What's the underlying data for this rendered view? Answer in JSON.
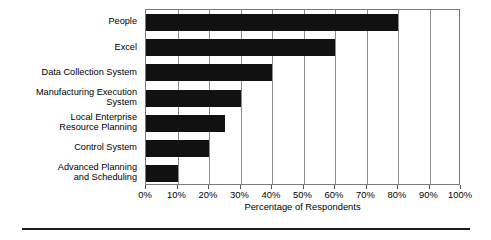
{
  "chart_data": {
    "type": "bar",
    "orientation": "horizontal",
    "title": "",
    "xlabel": "Percentage of Respondents",
    "ylabel": "",
    "categories": [
      "People",
      "Excel",
      "Data Collection System",
      "Manufacturing Execution\nSystem",
      "Local Enterprise\nResource Planning",
      "Control System",
      "Advanced Planning\nand Scheduling"
    ],
    "values": [
      80,
      60,
      40,
      30,
      25,
      20,
      10
    ],
    "value_unit": "%",
    "xlim": [
      0,
      100
    ],
    "xticks": [
      0,
      10,
      20,
      30,
      40,
      50,
      60,
      70,
      80,
      90,
      100
    ],
    "xtick_labels": [
      "0%",
      "10%",
      "20%",
      "30%",
      "40%",
      "50%",
      "60%",
      "70%",
      "80%",
      "90%",
      "100%"
    ],
    "grid": "vertical",
    "legend": "none",
    "bar_color": "#111111",
    "grid_color": "#8c8c8c",
    "frame_color": "#7a7a7a"
  }
}
